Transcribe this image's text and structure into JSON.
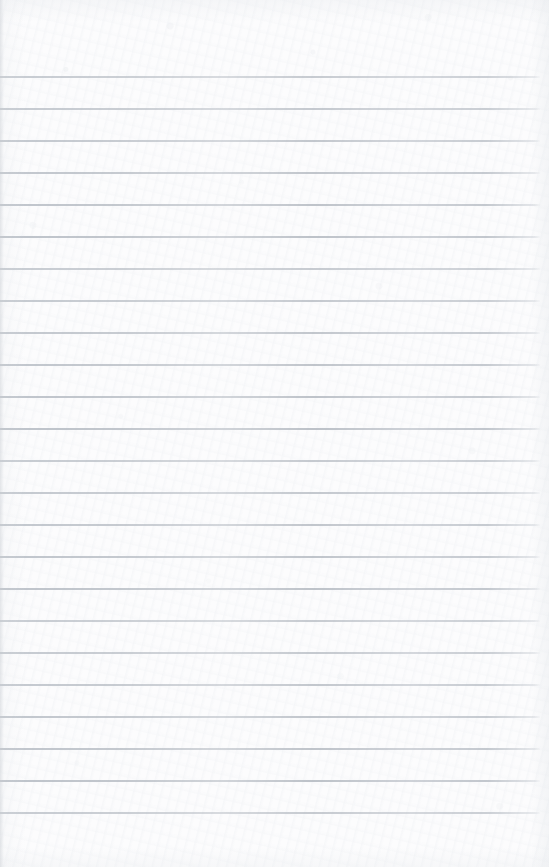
{
  "document": {
    "type": "lined-notebook-page",
    "title": "Blank ruled notebook page",
    "content_text": "",
    "page_width": 549,
    "page_height": 867,
    "paper_color": "#fcfcfd",
    "rule_color": "#b9bfc6",
    "rule_thickness_px": 2,
    "rule_spacing_px": 32,
    "first_rule_y": 76,
    "last_rule_y": 812,
    "rule_left_x": 0,
    "rule_right_x": 540,
    "header_margin_px": 76,
    "footer_margin_px": 55,
    "rule_count": 24,
    "handwriting_present": "none",
    "rule_y_positions": [
      76,
      108,
      140,
      172,
      204,
      236,
      268,
      300,
      332,
      364,
      396,
      428,
      460,
      492,
      524,
      556,
      588,
      620,
      652,
      684,
      716,
      748,
      780,
      812
    ]
  }
}
